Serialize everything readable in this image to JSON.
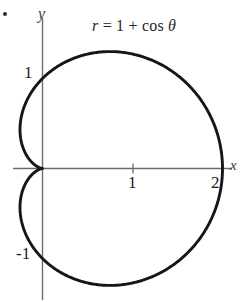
{
  "figure": {
    "kind": "polar-curve-plot",
    "background_color": "#ffffff",
    "curve_color": "#161616",
    "axis_color": "#6b6b6b",
    "text_color": "#1c1c1c",
    "bullet_marker": "•"
  },
  "equation": {
    "full": "r = 1 + cos θ",
    "r_symbol": "r",
    "equals": " = ",
    "constant": "1",
    "plus": " + ",
    "cos": "cos",
    "theta": "θ"
  },
  "axes": {
    "x_label": "x",
    "y_label": "y",
    "x_ticks": [
      {
        "value": 1,
        "label": "1"
      },
      {
        "value": 2,
        "label": "2"
      }
    ],
    "y_ticks": [
      {
        "value": 1,
        "label": "1"
      },
      {
        "value": -1,
        "label": "-1"
      }
    ],
    "origin_label": "",
    "x_range": [
      -0.35,
      2.12
    ],
    "y_range": [
      -1.45,
      1.65
    ],
    "grid": false
  },
  "chart_data": {
    "type": "line",
    "subtype": "polar",
    "xlabel": "x",
    "ylabel": "y",
    "xlim": [
      -0.35,
      2.12
    ],
    "ylim": [
      -1.45,
      1.65
    ],
    "grid": false,
    "legend": "none",
    "annotations": [
      "r = 1 + cos θ"
    ],
    "series": [
      {
        "name": "cardioid r = 1 + cos θ",
        "equation": "r = 1 + cos(theta)",
        "closed": true,
        "polar_points": [
          {
            "theta_deg": 0,
            "r": 2.0
          },
          {
            "theta_deg": 15,
            "r": 1.966
          },
          {
            "theta_deg": 30,
            "r": 1.866
          },
          {
            "theta_deg": 45,
            "r": 1.707
          },
          {
            "theta_deg": 60,
            "r": 1.5
          },
          {
            "theta_deg": 75,
            "r": 1.259
          },
          {
            "theta_deg": 90,
            "r": 1.0
          },
          {
            "theta_deg": 105,
            "r": 0.741
          },
          {
            "theta_deg": 120,
            "r": 0.5
          },
          {
            "theta_deg": 135,
            "r": 0.293
          },
          {
            "theta_deg": 150,
            "r": 0.134
          },
          {
            "theta_deg": 165,
            "r": 0.034
          },
          {
            "theta_deg": 180,
            "r": 0.0
          },
          {
            "theta_deg": 195,
            "r": 0.034
          },
          {
            "theta_deg": 210,
            "r": 0.134
          },
          {
            "theta_deg": 225,
            "r": 0.293
          },
          {
            "theta_deg": 240,
            "r": 0.5
          },
          {
            "theta_deg": 255,
            "r": 0.741
          },
          {
            "theta_deg": 270,
            "r": 1.0
          },
          {
            "theta_deg": 285,
            "r": 1.259
          },
          {
            "theta_deg": 300,
            "r": 1.5
          },
          {
            "theta_deg": 315,
            "r": 1.707
          },
          {
            "theta_deg": 330,
            "r": 1.866
          },
          {
            "theta_deg": 345,
            "r": 1.966
          },
          {
            "theta_deg": 360,
            "r": 2.0
          }
        ],
        "key_points": [
          {
            "label": "max radius on +x axis",
            "x": 2.0,
            "y": 0.0
          },
          {
            "label": "y-intercept upper",
            "x": 0.0,
            "y": 1.0
          },
          {
            "label": "y-intercept lower",
            "x": 0.0,
            "y": -1.0
          },
          {
            "label": "cusp at pole",
            "x": 0.0,
            "y": 0.0
          },
          {
            "label": "top extreme",
            "x": 0.75,
            "y": 1.299
          },
          {
            "label": "bottom extreme",
            "x": 0.75,
            "y": -1.299
          }
        ]
      }
    ]
  }
}
